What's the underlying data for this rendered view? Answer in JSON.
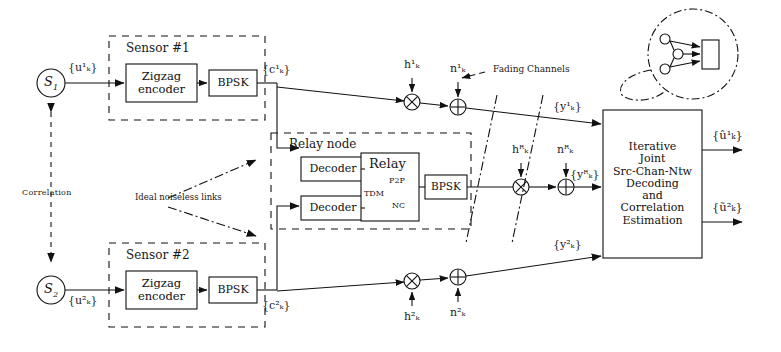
{
  "figure": {
    "type": "block-diagram"
  },
  "sources": [
    {
      "name": "S1",
      "symbol": "S",
      "index": "1",
      "out_label": "{u¹ₖ}"
    },
    {
      "name": "S2",
      "symbol": "S",
      "index": "2",
      "out_label": "{u²ₖ}"
    }
  ],
  "correlation": {
    "label": "Correlation"
  },
  "sensors": [
    {
      "title": "Sensor #1",
      "encoder": "Zigzag encoder",
      "modulator": "BPSK",
      "out_label": "{c¹ₖ}"
    },
    {
      "title": "Sensor #2",
      "encoder": "Zigzag encoder",
      "modulator": "BPSK",
      "out_label": "{c²ₖ}"
    }
  ],
  "relay": {
    "title": "Relay node",
    "decoder_1": "Decoder",
    "decoder_2": "Decoder",
    "core_title": "Relay",
    "core_modes": [
      "P2P",
      "TDM",
      "NC"
    ],
    "modulator": "BPSK"
  },
  "links": {
    "ideal_label": "Ideal noiseless links"
  },
  "channels": {
    "annotation": "Fading Channels",
    "paths": [
      {
        "id": "s1",
        "fading": "h¹ₖ",
        "noise": "n¹ₖ",
        "received": "{y¹ₖ}"
      },
      {
        "id": "relay",
        "fading": "hᴿₖ",
        "noise": "nᴿₖ",
        "received": "{yᴿₖ}"
      },
      {
        "id": "s2",
        "fading": "h²ₖ",
        "noise": "n²ₖ",
        "received": "{y²ₖ}"
      }
    ]
  },
  "receiver": {
    "lines": [
      "Iterative",
      "Joint",
      "Src-Chan-Ntw",
      "Decoding",
      "and",
      "Correlation",
      "Estimation"
    ],
    "outputs": [
      "{û¹ₖ}",
      "{ũ²ₖ}"
    ]
  },
  "callout": {
    "kind": "network-topology-inset",
    "nodes": 3,
    "sink": "rectangle"
  },
  "style": {
    "ink": "#111111",
    "paper": "#ffffff"
  }
}
